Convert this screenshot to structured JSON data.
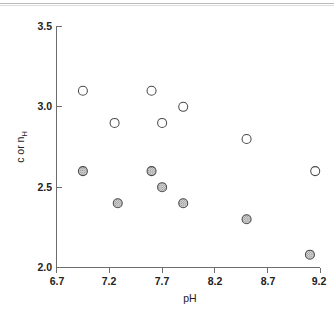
{
  "figure": {
    "kind": "scatter-plot",
    "background_color": "#ffffff",
    "top_rule_color": "#b9b9b9"
  },
  "axis_titles": {
    "x": "pH",
    "y_main": "c or n",
    "y_subscript": "H",
    "y_full": "c or n_H"
  },
  "chart_data": {
    "type": "scatter",
    "title": "",
    "subtitle": "",
    "xlabel": "pH",
    "ylabel": "c or n_H",
    "xlim": [
      6.7,
      9.2
    ],
    "ylim": [
      2.0,
      3.5
    ],
    "xticks": [
      6.7,
      7.2,
      7.7,
      8.2,
      8.7,
      9.2
    ],
    "yticks": [
      2.0,
      2.5,
      3.0,
      3.5
    ],
    "xtick_labels": [
      "6.7",
      "7.2",
      "7.7",
      "8.2",
      "8.7",
      "9.2"
    ],
    "ytick_labels": [
      "2.0",
      "2.5",
      "3.0",
      "3.5"
    ],
    "grid": false,
    "legend": null,
    "legend_position": "none",
    "annotations": [],
    "marker_size_px": 9,
    "series": [
      {
        "name": "open-circles",
        "marker": "open-circle",
        "fill_color": "#ffffff",
        "edge_color": "#4a4a4a",
        "x": [
          6.95,
          7.25,
          7.6,
          7.7,
          7.9,
          8.5,
          9.15
        ],
        "y": [
          3.1,
          2.9,
          3.1,
          2.9,
          3.0,
          2.8,
          2.6
        ]
      },
      {
        "name": "shaded-circles",
        "marker": "hatched-circle",
        "fill_color": "#c9c9c9",
        "edge_color": "#4a4a4a",
        "x": [
          6.95,
          7.28,
          7.6,
          7.7,
          7.9,
          8.5,
          9.1
        ],
        "y": [
          2.6,
          2.4,
          2.6,
          2.5,
          2.4,
          2.3,
          2.08
        ]
      }
    ]
  }
}
